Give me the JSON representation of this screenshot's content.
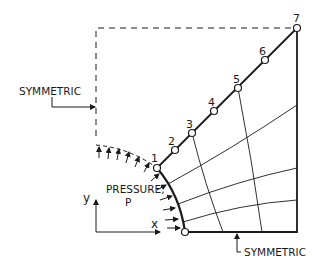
{
  "labels": {
    "symmetric_left": "SYMMETRIC",
    "symmetric_bottom": "SYMMETRIC",
    "pressure_line1": "PRESSURE,",
    "pressure_line2": "P",
    "axis_x": "x",
    "axis_y": "y"
  },
  "nodes": [
    {
      "id": "1",
      "x": 157,
      "y": 168
    },
    {
      "id": "2",
      "x": 175,
      "y": 150
    },
    {
      "id": "3",
      "x": 192,
      "y": 133
    },
    {
      "id": "4",
      "x": 214,
      "y": 111
    },
    {
      "id": "5",
      "x": 238,
      "y": 88
    },
    {
      "id": "6",
      "x": 265,
      "y": 60
    },
    {
      "id": "7",
      "x": 297,
      "y": 28
    }
  ],
  "colors": {
    "line": "#1a1a1a",
    "background": "#ffffff"
  }
}
